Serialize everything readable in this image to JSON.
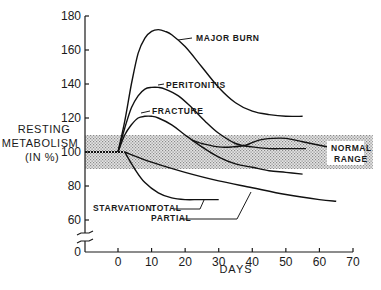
{
  "chart_data": {
    "type": "line",
    "title": "",
    "xlabel": "DAYS",
    "ylabel": [
      "RESTING",
      "METABOLISM",
      "(IN %)"
    ],
    "xlim": [
      -10,
      70
    ],
    "ylim": [
      0,
      180
    ],
    "x_ticks": [
      0,
      10,
      20,
      30,
      40,
      50,
      60,
      70
    ],
    "y_ticks": [
      0,
      60,
      80,
      100,
      120,
      140,
      160,
      180
    ],
    "y_axis_break": true,
    "grid": false,
    "legend": "inline annotations",
    "normal_range": {
      "label": [
        "NORMAL",
        "RANGE"
      ],
      "low": 90,
      "high": 110,
      "x_from": -10,
      "x_to": 75
    },
    "baseline": {
      "x": [
        -10,
        0,
        2
      ],
      "y": [
        100,
        100,
        100
      ]
    },
    "series": [
      {
        "name": "MAJOR BURN",
        "x": [
          0,
          2,
          4,
          6,
          8,
          10,
          12,
          14,
          16,
          20,
          25,
          30,
          35,
          40,
          45,
          50,
          55
        ],
        "y": [
          100,
          118,
          140,
          158,
          167,
          171,
          172,
          171,
          169,
          162,
          150,
          138,
          129,
          124,
          122,
          121,
          121
        ],
        "label_at": [
          17,
          171
        ]
      },
      {
        "name": "PERITONITIS",
        "x": [
          0,
          2,
          4,
          6,
          8,
          10,
          12,
          14,
          18,
          22,
          26,
          30,
          35,
          40,
          45,
          50,
          56
        ],
        "y": [
          100,
          114,
          126,
          133,
          137,
          138,
          138,
          137,
          133,
          126,
          118,
          111,
          105,
          103,
          102,
          102,
          102
        ],
        "label_at": [
          13,
          139
        ]
      },
      {
        "name": "FRACTURE",
        "x": [
          0,
          2,
          4,
          6,
          8,
          10,
          12,
          16,
          20,
          25,
          30,
          35,
          40,
          45,
          50,
          55
        ],
        "y": [
          100,
          110,
          116,
          120,
          121,
          121,
          120,
          116,
          110,
          103,
          97,
          93,
          91,
          89,
          88,
          87
        ],
        "label_at": [
          6,
          122
        ]
      },
      {
        "name": "NORMAL RANGE (convalescence)",
        "x": [
          25,
          30,
          34,
          38,
          42,
          46,
          50,
          55,
          60,
          65
        ],
        "y": [
          105,
          103,
          103,
          104,
          107,
          108,
          108,
          106,
          104,
          102
        ]
      },
      {
        "name": "STARVATION: TOTAL",
        "x": [
          2,
          5,
          8,
          12,
          16,
          20,
          24,
          28,
          30
        ],
        "y": [
          100,
          90,
          82,
          76,
          73,
          72,
          72,
          72,
          72
        ],
        "label_at": [
          25,
          73
        ]
      },
      {
        "name": "STARVATION: PARTIAL",
        "x": [
          2,
          10,
          20,
          30,
          40,
          50,
          60,
          65
        ],
        "y": [
          100,
          94,
          88,
          83,
          79,
          75,
          72,
          71
        ],
        "label_at": [
          40,
          79
        ]
      }
    ],
    "annotations": [
      "MAJOR BURN",
      "PERITONITIS",
      "FRACTURE",
      "NORMAL RANGE",
      "STARVATION:",
      "TOTAL",
      "PARTIAL"
    ]
  },
  "labels": {
    "ylabel_line1": "RESTING",
    "ylabel_line2": "METABOLISM",
    "ylabel_line3": "(IN %)",
    "xlabel": "DAYS",
    "major_burn": "MAJOR BURN",
    "peritonitis": "PERITONITIS",
    "fracture": "FRACTURE",
    "normal": "NORMAL",
    "range": "RANGE",
    "starvation": "STARVATION:",
    "total": "TOTAL",
    "partial": "PARTIAL"
  }
}
